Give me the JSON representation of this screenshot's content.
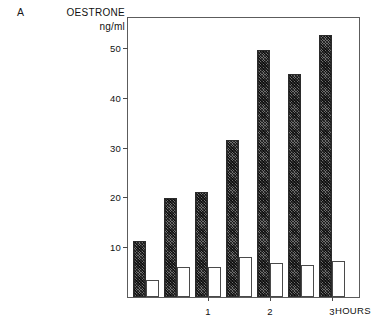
{
  "panel": {
    "letter": "A"
  },
  "header": {
    "title": "OESTRONE",
    "subtitle": "ng/ml"
  },
  "axes": {
    "y_ticks": [
      "10",
      "20",
      "30",
      "40",
      "50"
    ],
    "x_ticks": [
      "1",
      "2",
      "3"
    ],
    "x_unit_label": "HOURS"
  },
  "chart_data": {
    "type": "bar",
    "title": "OESTRONE",
    "subtitle": "ng/ml",
    "panel_label": "A",
    "xlabel": "HOURS",
    "ylabel": "ng/ml",
    "ylim": [
      0,
      56
    ],
    "xlim": [
      0,
      3.8
    ],
    "ytick_values": [
      10,
      20,
      30,
      40,
      50
    ],
    "xtick_values": [
      1,
      2,
      3
    ],
    "grid": false,
    "legend": null,
    "categories": [
      "0",
      "0.5",
      "1",
      "1.5",
      "2",
      "2.5",
      "3"
    ],
    "series": [
      {
        "name": "treated",
        "fill": "hatched-dark",
        "color": "#6e6e6e",
        "values": [
          11.3,
          19.8,
          21.0,
          31.5,
          49.5,
          44.8,
          44.8
        ]
      },
      {
        "name": "control",
        "fill": "open-white",
        "color": "#ffffff",
        "values": [
          3.5,
          6.0,
          6.0,
          8.0,
          6.8,
          6.5,
          7.2
        ]
      }
    ],
    "bars_in_plot_order": [
      {
        "index": 1,
        "fill": "hatched-dark",
        "value": 11.3
      },
      {
        "index": 1,
        "fill": "open-white",
        "value": 3.5
      },
      {
        "index": 2,
        "fill": "hatched-dark",
        "value": 19.8
      },
      {
        "index": 2,
        "fill": "open-white",
        "value": 6.0
      },
      {
        "index": 3,
        "fill": "hatched-dark",
        "value": 21.0
      },
      {
        "index": 3,
        "fill": "open-white",
        "value": 6.0
      },
      {
        "index": 4,
        "fill": "hatched-dark",
        "value": 31.5
      },
      {
        "index": 4,
        "fill": "open-white",
        "value": 8.0
      },
      {
        "index": 5,
        "fill": "hatched-dark",
        "value": 49.5
      },
      {
        "index": 5,
        "fill": "open-white",
        "value": 6.8
      },
      {
        "index": 6,
        "fill": "hatched-dark",
        "value": 44.8
      },
      {
        "index": 6,
        "fill": "open-white",
        "value": 6.5
      },
      {
        "index": 7,
        "fill": "hatched-dark",
        "value": 52.5
      },
      {
        "index": 7,
        "fill": "open-white",
        "value": 7.2
      }
    ]
  },
  "layout": {
    "plot_left_px": 127,
    "plot_top_px": 17,
    "plot_width_px": 233,
    "plot_height_px": 281,
    "y_max": 56,
    "bar_width_px": 13,
    "group_pitch_px": 31,
    "group_start_px": 5
  }
}
